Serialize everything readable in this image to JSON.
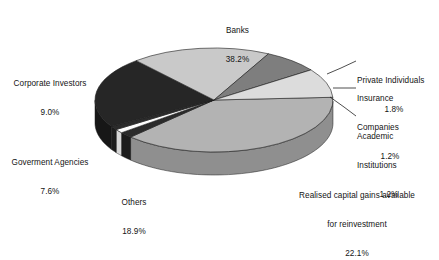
{
  "chart_data": {
    "type": "pie",
    "title": "",
    "subtitle": "",
    "xlabel": "",
    "ylabel": "",
    "legend_position": "none",
    "grid": false,
    "three_d": true,
    "units": "percent",
    "total": 100.0,
    "categories": [
      "Banks",
      "Private Individuals",
      "Insurance Companies",
      "Academic Institutions",
      "Realised capital gains available for reinvestment",
      "Others",
      "Goverment Agencies",
      "Corporate Investors"
    ],
    "values": [
      38.2,
      1.8,
      1.2,
      1.2,
      22.1,
      18.9,
      7.6,
      9.0
    ],
    "slices": [
      {
        "label": "Banks",
        "value": 38.2,
        "pct_text": "38.2%",
        "color": "#b3b3b3",
        "side_color": "#8f8f8f"
      },
      {
        "label": "Private Individuals",
        "value": 1.8,
        "pct_text": "1.8%",
        "color": "#2b2b2b",
        "side_color": "#1c1c1c"
      },
      {
        "label": "Insurance Companies",
        "value": 1.2,
        "pct_text": "1.2%",
        "color": "#fdfdfd",
        "side_color": "#d6d6d6"
      },
      {
        "label": "Academic Institutions",
        "value": 1.2,
        "pct_text": "1.2%",
        "color": "#2b2b2b",
        "side_color": "#1c1c1c"
      },
      {
        "label": "Realised capital gains available for reinvestment",
        "value": 22.1,
        "pct_text": "22.1%",
        "color": "#262626",
        "side_color": "#171717"
      },
      {
        "label": "Others",
        "value": 18.9,
        "pct_text": "18.9%",
        "color": "#c9c9c9",
        "side_color": "#a5a5a5"
      },
      {
        "label": "Goverment Agencies",
        "value": 7.6,
        "pct_text": "7.6%",
        "color": "#7e7e7e",
        "side_color": "#636363"
      },
      {
        "label": "Corporate Investors",
        "value": 9.0,
        "pct_text": "9.0%",
        "color": "#dcdcdc",
        "side_color": "#b6b6b6"
      }
    ]
  },
  "labels": {
    "banks": {
      "name": "Banks",
      "pct": "38.2%"
    },
    "corporate": {
      "name": "Corporate Investors",
      "pct": "9.0%"
    },
    "government": {
      "name": "Goverment Agencies",
      "pct": "7.6%"
    },
    "others": {
      "name": "Others",
      "pct": "18.9%"
    },
    "realised": {
      "line1": "Realised capital gains available",
      "line2": "for reinvestment",
      "pct": "22.1%"
    },
    "private": {
      "name": "Private Individuals",
      "pct": "1.8%"
    },
    "insurance": {
      "line1": "Insurance",
      "line2": "Companies",
      "pct": "1.2%"
    },
    "academic": {
      "line1": "Academic",
      "line2": "Institutions",
      "pct": "1.2%"
    }
  }
}
